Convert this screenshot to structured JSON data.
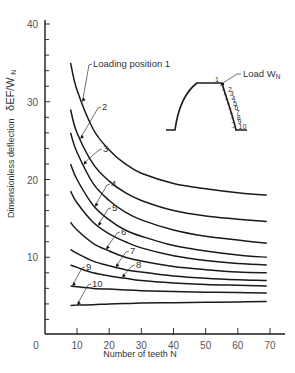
{
  "chart_data": {
    "type": "line",
    "title": "",
    "xlabel": "Number of teeth N",
    "ylabel": "Dimensionless deflection δEF/W_N",
    "ylabel_symbol": "δEF/W",
    "ylabel_subscript": "N",
    "ylabel_text": "Dimensionless deflection",
    "xlim": [
      0,
      75
    ],
    "ylim": [
      0,
      42
    ],
    "x_ticks": [
      10,
      20,
      30,
      40,
      50,
      60,
      70
    ],
    "y_ticks": [
      10,
      20,
      30,
      40
    ],
    "x_tick_labels": [
      "0",
      "10",
      "20",
      "30",
      "40",
      "50",
      "60",
      "70"
    ],
    "y_tick_labels": [
      "10",
      "20",
      "30",
      "40"
    ],
    "grid": false,
    "legend": "inline annotations",
    "x": [
      8,
      10,
      15,
      20,
      25,
      30,
      40,
      50,
      60,
      69
    ],
    "series": [
      {
        "name": "Loading position 1",
        "label": "Loading position 1",
        "values": [
          35.0,
          31.5,
          26.5,
          23.8,
          22.0,
          20.8,
          19.5,
          18.8,
          18.3,
          18.0
        ]
      },
      {
        "name": "2",
        "label": "2",
        "values": [
          29.0,
          26.0,
          22.0,
          19.8,
          18.3,
          17.3,
          16.0,
          15.3,
          14.9,
          14.6
        ]
      },
      {
        "name": "3",
        "label": "3",
        "values": [
          26.0,
          23.5,
          19.5,
          17.3,
          15.8,
          14.8,
          13.5,
          12.7,
          12.2,
          11.8
        ]
      },
      {
        "name": "4",
        "label": "4",
        "values": [
          22.0,
          20.0,
          16.7,
          14.8,
          13.5,
          12.7,
          11.5,
          10.8,
          10.3,
          10.0
        ]
      },
      {
        "name": "5",
        "label": "5",
        "values": [
          18.5,
          17.0,
          14.5,
          13.0,
          12.0,
          11.2,
          10.2,
          9.6,
          9.2,
          9.0
        ]
      },
      {
        "name": "6",
        "label": "6",
        "values": [
          14.5,
          13.5,
          11.8,
          10.8,
          10.0,
          9.5,
          8.8,
          8.4,
          8.1,
          8.0
        ]
      },
      {
        "name": "7",
        "label": "7",
        "values": [
          11.0,
          10.5,
          9.5,
          8.9,
          8.4,
          8.1,
          7.6,
          7.3,
          7.1,
          7.0
        ]
      },
      {
        "name": "8",
        "label": "8",
        "values": [
          9.0,
          8.7,
          8.0,
          7.6,
          7.3,
          7.0,
          6.7,
          6.5,
          6.4,
          6.3
        ]
      },
      {
        "name": "9",
        "label": "9",
        "values": [
          6.3,
          6.2,
          6.0,
          5.9,
          5.8,
          5.7,
          5.6,
          5.5,
          5.45,
          5.4
        ]
      },
      {
        "name": "10",
        "label": "10",
        "values": [
          3.8,
          3.85,
          3.9,
          4.0,
          4.05,
          4.1,
          4.15,
          4.2,
          4.25,
          4.3
        ]
      }
    ],
    "annotations": {
      "curve_labels": [
        {
          "text": "Loading position 1",
          "series": 0,
          "at_x": 11.5,
          "label_pos": [
            92,
            67
          ]
        },
        {
          "text": "2",
          "series": 1,
          "at_x": 11.0,
          "label_pos": [
            101,
            110
          ]
        },
        {
          "text": "3",
          "series": 2,
          "at_x": 12.0,
          "label_pos": [
            102,
            152
          ]
        },
        {
          "text": "4",
          "series": 3,
          "at_x": 15.5,
          "label_pos": [
            110,
            187
          ]
        },
        {
          "text": "5",
          "series": 4,
          "at_x": 16.5,
          "label_pos": [
            111,
            211
          ]
        },
        {
          "text": "6",
          "series": 5,
          "at_x": 19.0,
          "label_pos": [
            120,
            235
          ]
        },
        {
          "text": "7",
          "series": 6,
          "at_x": 22.0,
          "label_pos": [
            129,
            254
          ]
        },
        {
          "text": "8",
          "series": 7,
          "at_x": 24.0,
          "label_pos": [
            135,
            268
          ]
        },
        {
          "text": "9",
          "series": 8,
          "at_x": 8.5,
          "label_pos": [
            85,
            270
          ]
        },
        {
          "text": "10",
          "series": 9,
          "at_x": 10.0,
          "label_pos": [
            91,
            287
          ]
        }
      ],
      "inset": {
        "description": "Gear tooth profile showing load positions 1-10 along flank",
        "load_label": "Load W",
        "load_subscript": "N",
        "position_labels": [
          "1",
          "2",
          "3",
          "4",
          "5",
          "6",
          "7",
          "8",
          "9",
          "10"
        ]
      }
    }
  },
  "colors": {
    "line": "#1a1a1a",
    "axis": "#1a1a1a",
    "text": "#444444",
    "background": "#ffffff"
  }
}
